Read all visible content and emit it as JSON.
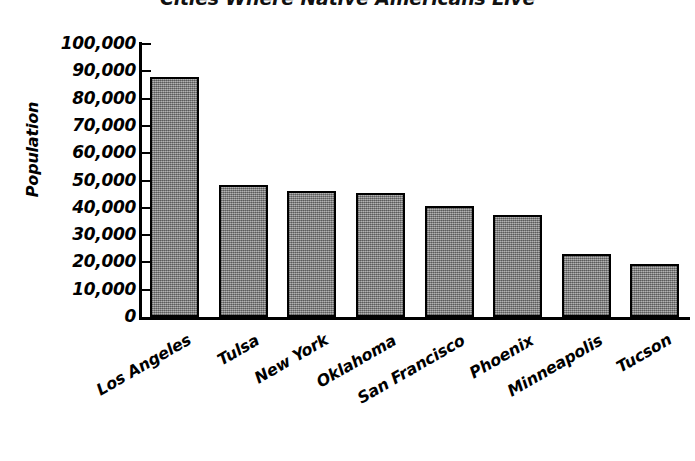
{
  "chart_data": {
    "type": "bar",
    "title": "Cities Where Native Americans Live",
    "xlabel": "",
    "ylabel": "Population",
    "ylim": [
      0,
      100000
    ],
    "ytick_labels": [
      "100,000",
      "90,000",
      "80,000",
      "70,000",
      "60,000",
      "50,000",
      "40,000",
      "30,000",
      "20,000",
      "10,000",
      "0"
    ],
    "ytick_values": [
      100000,
      90000,
      80000,
      70000,
      60000,
      50000,
      40000,
      30000,
      20000,
      10000,
      0
    ],
    "grid": false,
    "legend": "none",
    "bar_fill_color": "#8d8d8d",
    "bar_edge_color": "#000000",
    "background_color": "#ffffff",
    "categories": [
      "Los Angeles",
      "Tulsa",
      "New York",
      "Oklahoma",
      "San Francisco",
      "Phoenix",
      "Minneapolis",
      "Tucson"
    ],
    "values": [
      88000,
      48500,
      46000,
      45500,
      40500,
      37500,
      23000,
      19500
    ]
  }
}
